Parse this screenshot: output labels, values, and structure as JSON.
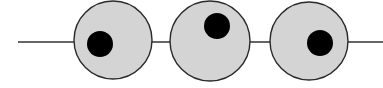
{
  "diagram": {
    "colors": {
      "line": "#333333",
      "circle_fill": "#d4d4d4",
      "circle_stroke": "#2a2a2a",
      "dot": "#000000"
    },
    "line": {
      "x1": 18,
      "x2": 383,
      "y": 42
    },
    "circles": [
      {
        "cx": 113,
        "cy": 40,
        "r": 39,
        "dot": {
          "cx": 100,
          "cy": 44,
          "r": 13
        }
      },
      {
        "cx": 210,
        "cy": 41,
        "r": 40,
        "dot": {
          "cx": 217,
          "cy": 26,
          "r": 13
        }
      },
      {
        "cx": 309,
        "cy": 41,
        "r": 39,
        "dot": {
          "cx": 320,
          "cy": 43,
          "r": 13
        }
      }
    ]
  }
}
